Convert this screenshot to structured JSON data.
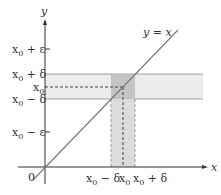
{
  "diagram": {
    "axes": {
      "x_label": "x",
      "y_label": "y",
      "origin_label": "0"
    },
    "line_label": "y = x",
    "y_ticks": [
      {
        "label_main": "x",
        "sub": "0",
        "suffix": " + ε",
        "name": "x0-plus-epsilon"
      },
      {
        "label_main": "x",
        "sub": "0",
        "suffix": " + δ",
        "name": "x0-plus-delta"
      },
      {
        "label_main": "x",
        "sub": "0",
        "suffix": "",
        "name": "x0"
      },
      {
        "label_main": "x",
        "sub": "0",
        "suffix": " − δ",
        "name": "x0-minus-delta"
      },
      {
        "label_main": "x",
        "sub": "0",
        "suffix": " − ε",
        "name": "x0-minus-epsilon"
      }
    ],
    "x_ticks": [
      {
        "label_main": "x",
        "sub": "0",
        "suffix": " − δ"
      },
      {
        "label_main": "x",
        "sub": "0",
        "suffix": ""
      },
      {
        "label_main": "x",
        "sub": "0",
        "suffix": " + δ"
      }
    ],
    "colors": {
      "band_light": "#ececec",
      "band_overlap": "#c8c8c8",
      "band_vertical": "#dcdcdc",
      "line": "#777777",
      "axis": "#333333"
    }
  }
}
